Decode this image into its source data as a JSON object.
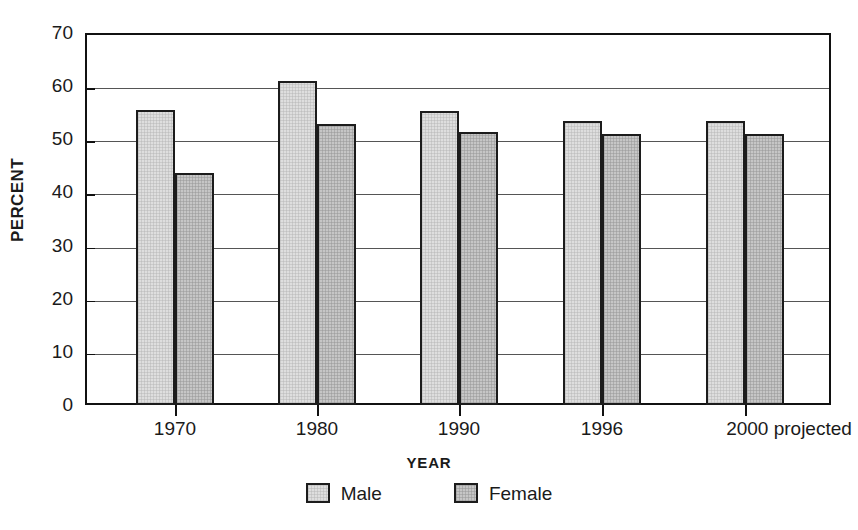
{
  "chart_data": {
    "type": "bar",
    "title": "",
    "xlabel": "YEAR",
    "ylabel": "PERCENT",
    "categories": [
      "1970",
      "1980",
      "1990",
      "1996",
      "2000 projected"
    ],
    "series": [
      {
        "name": "Male",
        "values": [
          55.6,
          61.0,
          55.4,
          53.4,
          53.4
        ],
        "color": "#dedede"
      },
      {
        "name": "Female",
        "values": [
          43.7,
          52.8,
          51.3,
          51.0,
          51.0
        ],
        "color": "#c6c6c6"
      }
    ],
    "ylim": [
      0,
      70
    ],
    "yticks": [
      0,
      10,
      20,
      30,
      40,
      50,
      60,
      70
    ],
    "ytick_labels": [
      "0",
      "10",
      "20",
      "30",
      "40",
      "50",
      "60",
      "70"
    ],
    "grid": true,
    "grid_axis": "y",
    "legend_position": "bottom-center",
    "bar_border_color": "#1c1c1c",
    "frame_color": "#111111"
  },
  "legend": {
    "items": [
      {
        "label": "Male"
      },
      {
        "label": "Female"
      }
    ]
  }
}
